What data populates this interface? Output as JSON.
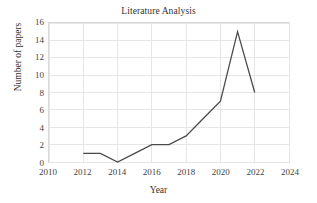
{
  "chart_data": {
    "type": "line",
    "title": "Literature Analysis",
    "xlabel": "Year",
    "ylabel": "Number of papers",
    "x": [
      2012,
      2013,
      2014,
      2015,
      2016,
      2017,
      2018,
      2019,
      2020,
      2021,
      2022
    ],
    "values": [
      1,
      1,
      0,
      1,
      2,
      2,
      3,
      5,
      7,
      15,
      8
    ],
    "series": [
      {
        "name": "Number of papers",
        "values": [
          1,
          1,
          0,
          1,
          2,
          2,
          3,
          5,
          7,
          15,
          8
        ]
      }
    ],
    "xlim": [
      2010,
      2024
    ],
    "ylim": [
      0,
      16
    ],
    "xticks": [
      "2010",
      "2012",
      "2014",
      "2016",
      "2018",
      "2020",
      "2022",
      "2024"
    ],
    "xtick_values": [
      2010,
      2012,
      2014,
      2016,
      2018,
      2020,
      2022,
      2024
    ],
    "yticks": [
      "0",
      "2",
      "4",
      "6",
      "8",
      "10",
      "12",
      "14",
      "16"
    ],
    "ytick_values": [
      0,
      2,
      4,
      6,
      8,
      10,
      12,
      14,
      16
    ],
    "grid": "horizontal-and-vertical",
    "legend": "none",
    "line_color": "#4a4a4a",
    "grid_color": "#e6e6e6",
    "border_color": "#d9d9d9",
    "background": "#ffffff"
  }
}
